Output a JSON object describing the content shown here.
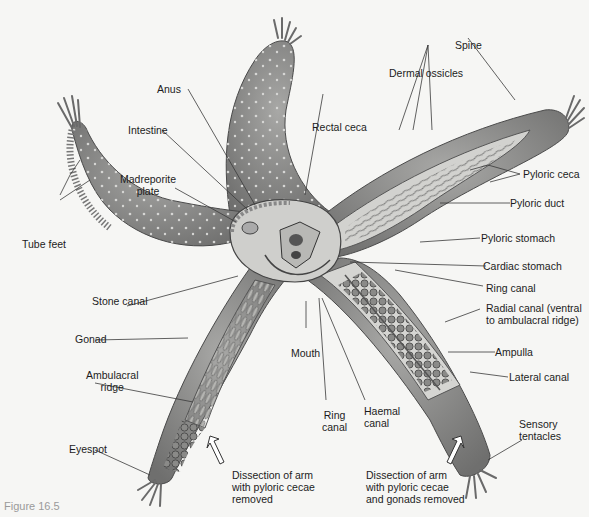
{
  "figure": {
    "caption": "Figure 16.5"
  },
  "labels": {
    "anus": "Anus",
    "intestine": "Intestine",
    "madreporite_plate": "Madreporite\nplate",
    "tube_feet": "Tube feet",
    "stone_canal": "Stone canal",
    "gonad": "Gonad",
    "ambulacral_ridge": "Ambulacral\nridge",
    "eyespot": "Eyespot",
    "mouth": "Mouth",
    "ring_canal_bottom": "Ring\ncanal",
    "haemal_canal": "Haemal\ncanal",
    "dissection_left": "Dissection of arm\nwith pyloric cecae\nremoved",
    "dissection_right": "Dissection of arm\nwith pyloric cecae\nand gonads removed",
    "sensory_tentacles": "Sensory\ntentacles",
    "spine": "Spine",
    "dermal_ossicles": "Dermal ossicles",
    "rectal_ceca": "Rectal ceca",
    "pyloric_ceca": "Pyloric ceca",
    "pyloric_duct": "Pyloric duct",
    "pyloric_stomach": "Pyloric stomach",
    "cardiac_stomach": "Cardiac stomach",
    "ring_canal_right": "Ring canal",
    "radial_canal": "Radial canal (ventral\nto ambulacral ridge)",
    "ampulla": "Ampulla",
    "lateral_canal": "Lateral canal"
  },
  "colors": {
    "arm_fill": "#8f8f8f",
    "arm_dark": "#6e6e6e",
    "interior_fill": "#c9c9c6",
    "leader_line": "#3a3a3a",
    "background": "#f6f6f4"
  }
}
